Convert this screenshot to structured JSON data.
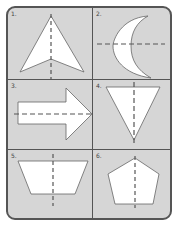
{
  "worksheet": {
    "title": "Lines of symmetry",
    "colors": {
      "background": "#d6d6d6",
      "shape_fill": "#ffffff",
      "stroke": "#555555",
      "dash": "#555555"
    },
    "cells": [
      {
        "number": "1.",
        "shape": "arrowhead",
        "symmetry_line": "vertical"
      },
      {
        "number": "2.",
        "shape": "crescent",
        "symmetry_line": "horizontal"
      },
      {
        "number": "3.",
        "shape": "arrow-right",
        "symmetry_line": "horizontal"
      },
      {
        "number": "4.",
        "shape": "inverted-triangle",
        "symmetry_line": "vertical"
      },
      {
        "number": "5.",
        "shape": "trapezoid",
        "symmetry_line": "vertical"
      },
      {
        "number": "6.",
        "shape": "pentagon",
        "symmetry_line": "vertical"
      }
    ]
  }
}
